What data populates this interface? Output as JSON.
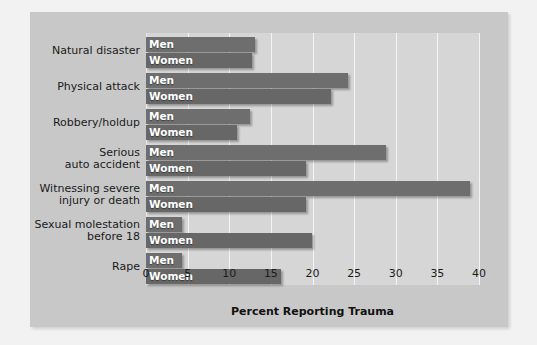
{
  "chart_data": {
    "type": "bar",
    "orientation": "horizontal",
    "title": "",
    "xlabel": "Percent Reporting Trauma",
    "ylabel": "",
    "xlim": [
      0,
      40
    ],
    "xticks": [
      "0",
      "5",
      "10",
      "15",
      "20",
      "25",
      "30",
      "35",
      "40"
    ],
    "xtick_values": [
      0,
      5,
      10,
      15,
      20,
      25,
      30,
      35,
      40
    ],
    "grid": true,
    "legend_position": "in-bar",
    "series_names": [
      "Men",
      "Women"
    ],
    "categories": [
      "Natural disaster",
      "Physical attack",
      "Robbery/holdup",
      "Serious\nauto accident",
      "Witnessing severe\ninjury or death",
      "Sexual molestation\nbefore 18",
      "Rape"
    ],
    "series": [
      {
        "name": "Men",
        "values": [
          13.1,
          24.3,
          12.5,
          28.8,
          38.9,
          4.3,
          0.3
        ]
      },
      {
        "name": "Women",
        "values": [
          12.7,
          22.2,
          10.9,
          19.2,
          19.2,
          19.9,
          16.2
        ]
      }
    ],
    "colors": {
      "bar_men": "#6e6e6e",
      "bar_women": "#676767",
      "plot_background": "#d6d6d6",
      "panel_background": "#c8c8c8",
      "gridline": "#f4f4f4",
      "text": "#1b1b1b",
      "bar_label_text": "#ffffff"
    }
  }
}
